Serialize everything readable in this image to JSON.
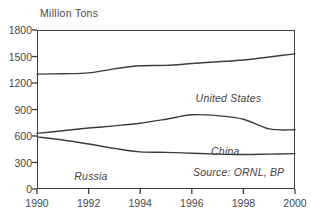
{
  "chart_data": {
    "type": "line",
    "title": "",
    "subtitle": "",
    "xlabel": "",
    "ylabel": "Million Tons",
    "ylim": [
      0,
      1800
    ],
    "xlim": [
      1990,
      2000
    ],
    "grid": false,
    "legend_position": "inline-series-labels",
    "yticks": [
      "0",
      "300",
      "600",
      "900",
      "1200",
      "1500",
      "1800"
    ],
    "xticks": [
      "1990",
      "1992",
      "1994",
      "1996",
      "1998",
      "2000"
    ],
    "x": [
      1990,
      1991,
      1992,
      1993,
      1994,
      1995,
      1996,
      1997,
      1998,
      1999,
      2000
    ],
    "series": [
      {
        "name": "United States",
        "values": [
          1300,
          1305,
          1315,
          1360,
          1395,
          1400,
          1420,
          1440,
          1460,
          1495,
          1530
        ]
      },
      {
        "name": "China",
        "values": [
          630,
          660,
          690,
          715,
          745,
          790,
          840,
          830,
          790,
          680,
          670
        ]
      },
      {
        "name": "Russia",
        "values": [
          590,
          555,
          510,
          460,
          420,
          415,
          405,
          395,
          390,
          395,
          400
        ]
      }
    ],
    "annotations": [
      {
        "text": "United States",
        "series": "United States"
      },
      {
        "text": "China",
        "series": "China"
      },
      {
        "text": "Russia",
        "series": "Russia"
      },
      {
        "text": "Source: ORNL, BP",
        "series": null
      }
    ],
    "source": "Source: ORNL, BP",
    "colors": {
      "line": "#3d3d3d",
      "frame": "#3d3d3d",
      "text": "#474747"
    }
  }
}
